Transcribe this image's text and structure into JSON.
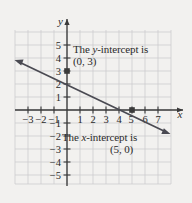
{
  "chart_data": {
    "type": "line",
    "title": "",
    "xlabel": "x",
    "ylabel": "y",
    "grid": true,
    "legend": "none",
    "xlim": [
      -3.8,
      8.2
    ],
    "ylim": [
      -5.8,
      5.8
    ],
    "xticks": [
      -3,
      -2,
      -1,
      1,
      2,
      3,
      4,
      5,
      6,
      7
    ],
    "yticks": [
      -5,
      -4,
      -3,
      -2,
      -1,
      1,
      2,
      3,
      4,
      5
    ],
    "xtick_labels": [
      "-3",
      "-2",
      "-1",
      "1",
      "2",
      "3",
      "4",
      "5",
      "6",
      "7"
    ],
    "ytick_labels": [
      "-5",
      "-4",
      "-3",
      "-2",
      "-1",
      "1",
      "2",
      "3",
      "4",
      "5"
    ],
    "series": [
      {
        "name": "line",
        "equation_points": [
          [
            -3.6,
            5.16
          ],
          [
            8.0,
            -1.8
          ]
        ],
        "slope": -0.6,
        "y_intercept": 3,
        "x_intercept": 5,
        "arrows": "both",
        "color": "#4a4a52"
      }
    ],
    "points": [
      {
        "label": "(0, 3)",
        "x": 0,
        "y": 3,
        "marker": "square"
      },
      {
        "label": "(5, 0)",
        "x": 5,
        "y": 0,
        "marker": "square"
      }
    ]
  },
  "annotations": {
    "y_intercept": {
      "line1_pre": "The ",
      "line1_var": "y",
      "line1_post": "-intercept is",
      "line2": "(0, 3)"
    },
    "x_intercept": {
      "line1_pre": "The ",
      "line1_var": "x",
      "line1_post": "-intercept is",
      "line2": "(5, 0)"
    }
  },
  "axis_labels": {
    "x": "x",
    "y": "y"
  },
  "colors": {
    "background": "#f2f1ef",
    "grid": "#c9c7cc",
    "axis": "#3a3a3a",
    "line": "#4a4a52",
    "text": "#2a2a2a"
  }
}
